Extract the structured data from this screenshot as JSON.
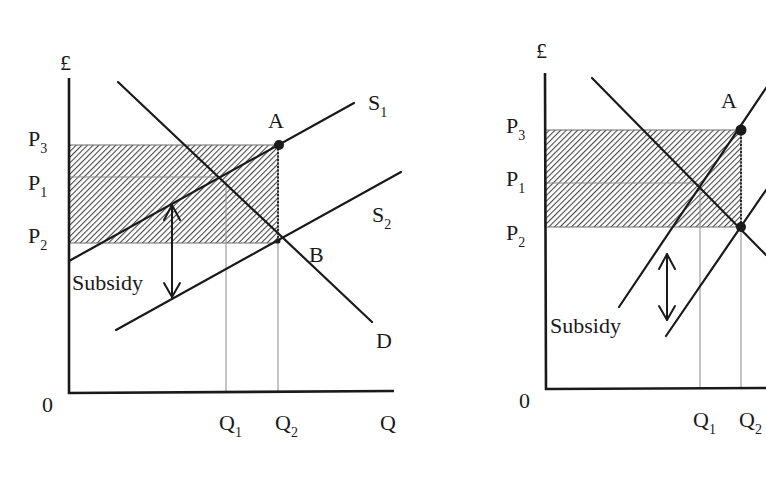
{
  "diagrams": [
    {
      "id": "left",
      "title": "Subsidy with relatively elastic demand",
      "y_axis_label": "£",
      "x_axis_label": "Q",
      "origin_label": "0",
      "price_labels": [
        {
          "base": "P",
          "sub": "3"
        },
        {
          "base": "P",
          "sub": "1"
        },
        {
          "base": "P",
          "sub": "2"
        }
      ],
      "quantity_labels": [
        {
          "base": "Q",
          "sub": "1"
        },
        {
          "base": "Q",
          "sub": "2"
        }
      ],
      "curve_labels": {
        "s1": {
          "base": "S",
          "sub": "1"
        },
        "s2": {
          "base": "S",
          "sub": "2"
        },
        "d": "D"
      },
      "point_labels": {
        "a": "A",
        "b": "B"
      },
      "subsidy_label": "Subsidy",
      "shaded_area": "Total subsidy cost (P3 to P2 × Q2)"
    },
    {
      "id": "right",
      "title": "Subsidy with relatively inelastic supply",
      "y_axis_label": "£",
      "origin_label": "0",
      "price_labels": [
        {
          "base": "P",
          "sub": "3"
        },
        {
          "base": "P",
          "sub": "1"
        },
        {
          "base": "P",
          "sub": "2"
        }
      ],
      "quantity_labels": [
        {
          "base": "Q",
          "sub": "1"
        },
        {
          "base": "Q",
          "sub": "2"
        }
      ],
      "point_labels": {
        "a": "A"
      },
      "subsidy_label": "Subsidy",
      "shaded_area": "Total subsidy cost (P3 to P2 × Q2)"
    }
  ],
  "colors": {
    "line": "#1a1a1a",
    "guide": "#8a8a8a",
    "hatch": "#555555",
    "background": "#ffffff"
  }
}
